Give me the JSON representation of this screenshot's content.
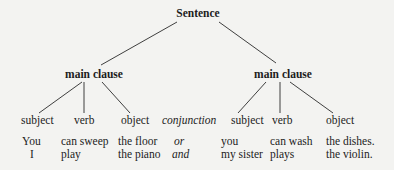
{
  "diagram": {
    "type": "sentence-tree",
    "root": "Sentence",
    "clauses": [
      {
        "label": "main clause",
        "roles": [
          "subject",
          "verb",
          "object"
        ],
        "examples": [
          [
            "You",
            "can sweep",
            "the floor"
          ],
          [
            "I",
            "play",
            "the piano"
          ]
        ]
      },
      {
        "label": "main clause",
        "roles": [
          "subject",
          "verb",
          "object"
        ],
        "examples": [
          [
            "you",
            "can wash",
            "the dishes."
          ],
          [
            "my sister",
            "plays",
            "the violin."
          ]
        ]
      }
    ],
    "conjunction": {
      "label": "conjunction",
      "examples": [
        "or",
        "and"
      ]
    }
  },
  "colors": {
    "ink": "#1c1c1c",
    "paper": "#f3f3f1"
  }
}
